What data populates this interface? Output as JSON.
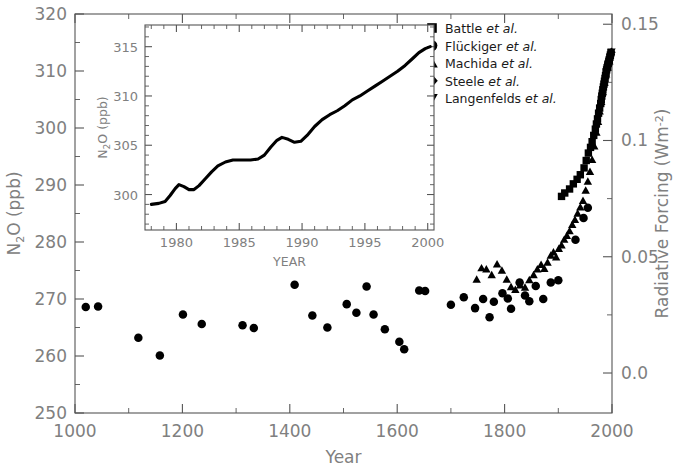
{
  "chart_data": {
    "type": "scatter",
    "title": "",
    "xlabel": "Year",
    "ylabel": "N2O (ppb)",
    "ylabel_right": "Radiative Forcing (Wm-2)",
    "xlim": [
      1000,
      2000
    ],
    "ylim": [
      250,
      320
    ],
    "ylim_right": [
      -0.0172,
      0.1544
    ],
    "xticks": [
      1000,
      1200,
      1400,
      1600,
      1800,
      2000
    ],
    "xtick_labels": [
      "1000",
      "1200",
      "1400",
      "1600",
      "1800",
      "2000"
    ],
    "xminor_step": 100,
    "yticks": [
      250,
      260,
      270,
      280,
      290,
      300,
      310,
      320
    ],
    "ytick_labels": [
      "250",
      "260",
      "270",
      "280",
      "290",
      "300",
      "310",
      "320"
    ],
    "yminor_step": 5,
    "right_ticks": [
      0.0,
      0.05,
      0.1,
      0.15
    ],
    "right_tick_labels": [
      "0.0",
      "0.05",
      "0.1",
      "0.15"
    ],
    "right_minor_step": 0.025,
    "grid": false,
    "legend_position": "top-right",
    "series": [
      {
        "name": "Battle et al.",
        "marker": "square",
        "points": [
          [
            1906,
            288.0
          ],
          [
            1912,
            288.6
          ],
          [
            1921,
            289.3
          ],
          [
            1928,
            290.2
          ],
          [
            1935,
            291.0
          ],
          [
            1941,
            291.8
          ],
          [
            1948,
            293.0
          ],
          [
            1952,
            294.3
          ],
          [
            1956,
            295.6
          ],
          [
            1960,
            296.6
          ],
          [
            1963,
            297.6
          ],
          [
            1966,
            298.7
          ],
          [
            1969,
            299.8
          ],
          [
            1971,
            300.7
          ],
          [
            1973,
            301.6
          ],
          [
            1975,
            302.6
          ],
          [
            1977,
            303.5
          ],
          [
            1979,
            304.3
          ],
          [
            1980,
            305.0
          ],
          [
            1981,
            305.6
          ],
          [
            1982,
            306.1
          ],
          [
            1983,
            306.7
          ],
          [
            1984,
            307.2
          ],
          [
            1985,
            307.7
          ],
          [
            1986,
            308.2
          ],
          [
            1987,
            308.7
          ],
          [
            1988,
            309.2
          ],
          [
            1989,
            309.8
          ],
          [
            1990,
            310.2
          ],
          [
            1991,
            310.6
          ],
          [
            1992,
            310.9
          ],
          [
            1993,
            311.3
          ],
          [
            1994,
            311.6
          ],
          [
            1995,
            312.0
          ],
          [
            1996,
            312.4
          ],
          [
            1997,
            312.8
          ],
          [
            1998,
            313.2
          ]
        ]
      },
      {
        "name": "Flückiger et al.",
        "marker": "circle",
        "points": [
          [
            1020,
            268.6
          ],
          [
            1043,
            268.7
          ],
          [
            1118,
            263.2
          ],
          [
            1158,
            260.1
          ],
          [
            1201,
            267.3
          ],
          [
            1236,
            265.6
          ],
          [
            1312,
            265.4
          ],
          [
            1333,
            264.9
          ],
          [
            1409,
            272.5
          ],
          [
            1442,
            267.1
          ],
          [
            1470,
            265.0
          ],
          [
            1506,
            269.1
          ],
          [
            1524,
            267.6
          ],
          [
            1543,
            272.2
          ],
          [
            1556,
            267.3
          ],
          [
            1577,
            264.7
          ],
          [
            1604,
            262.5
          ],
          [
            1613,
            261.2
          ],
          [
            1641,
            271.5
          ],
          [
            1652,
            271.4
          ],
          [
            1700,
            269.0
          ],
          [
            1724,
            270.3
          ],
          [
            1745,
            268.4
          ],
          [
            1760,
            270.0
          ],
          [
            1772,
            266.8
          ],
          [
            1780,
            269.5
          ],
          [
            1796,
            271.0
          ],
          [
            1806,
            270.1
          ],
          [
            1812,
            268.3
          ],
          [
            1828,
            272.9
          ],
          [
            1838,
            270.6
          ],
          [
            1846,
            269.6
          ],
          [
            1858,
            272.3
          ],
          [
            1872,
            270.0
          ],
          [
            1886,
            272.9
          ],
          [
            1900,
            273.3
          ],
          [
            1932,
            280.4
          ],
          [
            1947,
            284.2
          ],
          [
            1955,
            286.0
          ]
        ]
      },
      {
        "name": "Machida et al.",
        "marker": "triangle-up",
        "points": [
          [
            1748,
            273.4
          ],
          [
            1757,
            275.4
          ],
          [
            1766,
            275.2
          ],
          [
            1776,
            274.2
          ],
          [
            1786,
            276.1
          ],
          [
            1795,
            275.0
          ],
          [
            1804,
            273.4
          ],
          [
            1812,
            272.1
          ],
          [
            1820,
            271.6
          ],
          [
            1829,
            272.4
          ],
          [
            1838,
            272.0
          ],
          [
            1846,
            273.3
          ],
          [
            1854,
            274.2
          ],
          [
            1861,
            275.2
          ],
          [
            1868,
            276.0
          ],
          [
            1874,
            275.3
          ],
          [
            1880,
            276.4
          ],
          [
            1886,
            277.6
          ],
          [
            1891,
            278.2
          ],
          [
            1896,
            277.3
          ],
          [
            1901,
            278.8
          ],
          [
            1906,
            279.4
          ],
          [
            1911,
            280.4
          ],
          [
            1916,
            281.1
          ],
          [
            1921,
            281.9
          ],
          [
            1926,
            283.0
          ],
          [
            1931,
            283.9
          ],
          [
            1936,
            285.0
          ],
          [
            1941,
            286.1
          ],
          [
            1946,
            287.2
          ],
          [
            1951,
            289.0
          ],
          [
            1955,
            290.6
          ],
          [
            1959,
            292.3
          ],
          [
            1963,
            294.4
          ],
          [
            1967,
            296.8
          ],
          [
            1971,
            299.2
          ],
          [
            1974,
            301.1
          ],
          [
            1977,
            302.9
          ],
          [
            1980,
            304.6
          ],
          [
            1983,
            306.3
          ],
          [
            1986,
            307.9
          ],
          [
            1989,
            309.4
          ],
          [
            1992,
            310.6
          ],
          [
            1995,
            311.7
          ]
        ]
      },
      {
        "name": "Steele et al.",
        "marker": "diamond",
        "points": [
          [
            1990,
            310.4
          ],
          [
            1992,
            311.0
          ],
          [
            1994,
            311.6
          ],
          [
            1996,
            312.2
          ],
          [
            1998,
            312.9
          ],
          [
            1999,
            313.3
          ]
        ]
      },
      {
        "name": "Langenfelds et al.",
        "marker": "triangle-down",
        "points": [
          [
            1993,
            311.2
          ],
          [
            1995,
            311.8
          ],
          [
            1997,
            312.5
          ],
          [
            1999,
            313.4
          ]
        ]
      }
    ]
  },
  "inset": {
    "xlabel": "YEAR",
    "ylabel": "N2O (ppb)",
    "xlim": [
      1977.5,
      2000.5
    ],
    "ylim": [
      296.4,
      317.2
    ],
    "xticks": [
      1980,
      1985,
      1990,
      1995,
      2000
    ],
    "xtick_labels": [
      "1980",
      "1985",
      "1990",
      "1995",
      "2000"
    ],
    "yticks": [
      300,
      305,
      310,
      315
    ],
    "ytick_labels": [
      "300",
      "305",
      "310",
      "315"
    ],
    "xminor_step": 1,
    "yminor_step": 1,
    "type": "line",
    "curve": [
      [
        1978.0,
        299.0
      ],
      [
        1978.6,
        299.1
      ],
      [
        1979.1,
        299.3
      ],
      [
        1979.5,
        299.9
      ],
      [
        1979.9,
        300.6
      ],
      [
        1980.2,
        301.0
      ],
      [
        1980.6,
        300.8
      ],
      [
        1981.0,
        300.5
      ],
      [
        1981.4,
        300.5
      ],
      [
        1981.8,
        300.9
      ],
      [
        1982.3,
        301.6
      ],
      [
        1982.8,
        302.3
      ],
      [
        1983.3,
        302.9
      ],
      [
        1983.9,
        303.3
      ],
      [
        1984.5,
        303.5
      ],
      [
        1985.2,
        303.5
      ],
      [
        1985.9,
        303.5
      ],
      [
        1986.5,
        303.6
      ],
      [
        1987.0,
        304.0
      ],
      [
        1987.5,
        304.8
      ],
      [
        1988.0,
        305.5
      ],
      [
        1988.4,
        305.8
      ],
      [
        1988.9,
        305.6
      ],
      [
        1989.4,
        305.3
      ],
      [
        1989.9,
        305.4
      ],
      [
        1990.4,
        306.0
      ],
      [
        1991.0,
        306.9
      ],
      [
        1991.6,
        307.6
      ],
      [
        1992.2,
        308.1
      ],
      [
        1992.8,
        308.5
      ],
      [
        1993.4,
        309.0
      ],
      [
        1994.0,
        309.6
      ],
      [
        1994.6,
        310.0
      ],
      [
        1995.2,
        310.5
      ],
      [
        1995.8,
        311.0
      ],
      [
        1996.4,
        311.5
      ],
      [
        1997.0,
        312.0
      ],
      [
        1997.6,
        312.5
      ],
      [
        1998.2,
        313.1
      ],
      [
        1998.8,
        313.8
      ],
      [
        1999.3,
        314.4
      ],
      [
        1999.8,
        314.8
      ],
      [
        2000.2,
        315.0
      ]
    ]
  },
  "legend": {
    "items": [
      {
        "marker": "square",
        "name": "Battle",
        "suffix": "et al."
      },
      {
        "marker": "circle",
        "name": "Flückiger",
        "suffix": "et al."
      },
      {
        "marker": "triangle-up",
        "name": "Machida",
        "suffix": "et al."
      },
      {
        "marker": "diamond",
        "name": "Steele",
        "suffix": "et al."
      },
      {
        "marker": "triangle-down",
        "name": "Langenfelds",
        "suffix": "et al."
      }
    ]
  },
  "colors": {
    "marker": "#000000",
    "axis": "#555555",
    "label": "#808080",
    "background": "#ffffff"
  }
}
